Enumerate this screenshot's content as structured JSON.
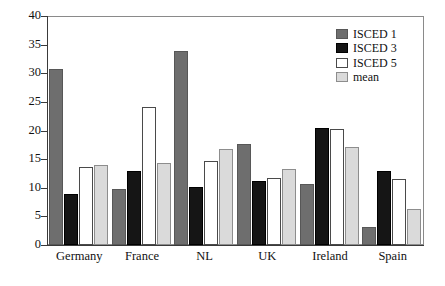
{
  "chart_data": {
    "type": "bar",
    "title": "",
    "subtitle": "",
    "xlabel": "",
    "ylabel": "",
    "ylim": [
      0,
      40
    ],
    "yticks": [
      0,
      5,
      10,
      15,
      20,
      25,
      30,
      35,
      40
    ],
    "ytick_labels": [
      "0",
      "5",
      "10",
      "15",
      "20",
      "25",
      "30",
      "35",
      "40"
    ],
    "grid": false,
    "legend_position": "top-right",
    "categories": [
      "Germany",
      "France",
      "NL",
      "UK",
      "Ireland",
      "Spain"
    ],
    "series": [
      {
        "name": "ISCED 1",
        "color": "#6e6e6e",
        "values": [
          30.8,
          9.8,
          33.9,
          17.6,
          10.7,
          3.1
        ]
      },
      {
        "name": "ISCED 3",
        "color": "#151515",
        "values": [
          8.9,
          12.9,
          10.2,
          11.2,
          20.4,
          12.9
        ]
      },
      {
        "name": "ISCED 5",
        "color": "#ffffff",
        "values": [
          13.7,
          24.1,
          14.7,
          11.7,
          20.3,
          11.5
        ]
      },
      {
        "name": "mean",
        "color": "#dadada",
        "values": [
          14.0,
          14.3,
          16.7,
          13.3,
          17.1,
          6.3
        ]
      }
    ],
    "annotations": []
  },
  "legend": {
    "items": [
      {
        "label": "ISCED 1",
        "swatch": "dark-gray-swatch"
      },
      {
        "label": "ISCED 3",
        "swatch": "black-swatch"
      },
      {
        "label": "ISCED 5",
        "swatch": "white-swatch"
      },
      {
        "label": "mean",
        "swatch": "light-gray-swatch"
      }
    ]
  }
}
